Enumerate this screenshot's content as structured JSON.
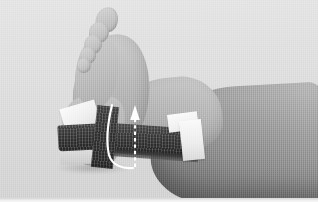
{
  "figure": {
    "kind": "photograph",
    "color_mode": "grayscale",
    "width_px": 318,
    "height_px": 202
  },
  "palette": {
    "background": "#dcdcdc",
    "skin_light": "#c8c8c8",
    "skin_mid": "#a6a6a6",
    "skin_dark": "#6f6f6f",
    "tape_dark": "#2b2b2b",
    "tape_white": "#fafafa",
    "annotation": "#ffffff",
    "base_strip": "#f2f2f2"
  },
  "anatomy": [
    {
      "id": "toes",
      "label": "toes"
    },
    {
      "id": "forefoot",
      "label": "forefoot"
    },
    {
      "id": "instep",
      "label": "instep"
    },
    {
      "id": "heel",
      "label": "heel"
    },
    {
      "id": "ankle",
      "label": "ankle"
    },
    {
      "id": "leg",
      "label": "lower leg"
    }
  ],
  "taping": {
    "white_anchors": [
      {
        "id": "anchor-arch",
        "label": "white anchor strip on arch"
      },
      {
        "id": "anchor-shin",
        "label": "white anchor strip on lower shin"
      }
    ],
    "dark_strips": [
      {
        "id": "tape-vertical",
        "label": "dark vertical stirrup over heel"
      },
      {
        "id": "tape-heel",
        "label": "dark heel lock"
      },
      {
        "id": "tape-long",
        "label": "dark longitudinal strip along Achilles"
      }
    ]
  },
  "annotations": {
    "curved_line": {
      "name": "tape-path-line",
      "style": "solid",
      "color": "#ffffff",
      "label": "solid white curved line tracing the tape path around the heel"
    },
    "arrow": {
      "name": "direction-arrow",
      "style": "dashed",
      "color": "#ffffff",
      "direction": "up",
      "label": "white dashed arrow pointing upward indicating direction of tape pull"
    }
  }
}
